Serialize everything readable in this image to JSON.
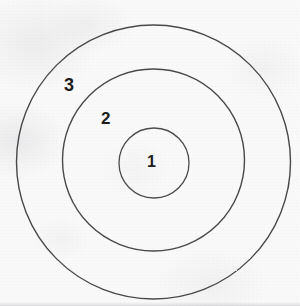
{
  "diagram": {
    "type": "concentric-circles",
    "background_color": "#f9f9f9",
    "stroke_color": "#3a3a3a",
    "label_color": "#1d1d1d",
    "canvas": {
      "width": 300,
      "height": 306
    },
    "rings": [
      {
        "id": "outer",
        "label": "3",
        "cx": 153.5,
        "cy": 162,
        "r": 137,
        "stroke_width": 1.4,
        "label_x": 64,
        "label_y": 76
      },
      {
        "id": "middle",
        "label": "2",
        "cx": 153.5,
        "cy": 160,
        "r": 91,
        "stroke_width": 1.4,
        "label_x": 101,
        "label_y": 110
      },
      {
        "id": "inner",
        "label": "1",
        "cx": 154,
        "cy": 163,
        "r": 35,
        "stroke_width": 1.3,
        "label_x": 147,
        "label_y": 154
      }
    ]
  },
  "chart_data": {
    "type": "diagram",
    "series": [
      {
        "name": "3",
        "radius": 137,
        "center": [
          153.5,
          162
        ]
      },
      {
        "name": "2",
        "radius": 91,
        "center": [
          153.5,
          160
        ]
      },
      {
        "name": "1",
        "radius": 35,
        "center": [
          154,
          163
        ]
      }
    ],
    "labels": [
      "3",
      "2",
      "1"
    ],
    "xlabel": "",
    "ylabel": ""
  }
}
